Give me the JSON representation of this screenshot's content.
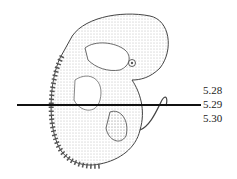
{
  "figure": {
    "section_levels": [
      {
        "label": "5.28",
        "y": 90
      },
      {
        "label": "5.29",
        "y": 104,
        "has_line": true
      },
      {
        "label": "5.30",
        "y": 118
      }
    ]
  }
}
